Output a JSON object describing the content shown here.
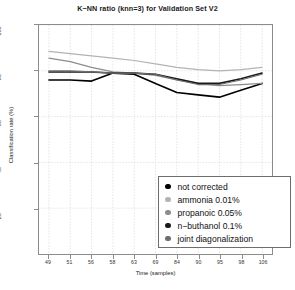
{
  "chart_data": {
    "type": "line",
    "title": "K−NN ratio (knn=3) for Validation Set V2",
    "xlabel": "Time (samples)",
    "ylabel": "Classification rate (%)",
    "xlim": [
      0,
      10
    ],
    "ylim": [
      0,
      100
    ],
    "grid": true,
    "legend_position": "bottom-right",
    "categories": [
      "49",
      "51",
      "56",
      "58",
      "63",
      "69",
      "84",
      "90",
      "95",
      "98",
      "106"
    ],
    "yticks": [
      "100",
      "80",
      "60",
      "40",
      "20"
    ],
    "ytick_values": [
      100,
      80,
      60,
      40,
      20
    ],
    "series": [
      {
        "name": "not corrected",
        "color": "#000000",
        "width": 1.6,
        "values": [
          76,
          76,
          75.5,
          79,
          78.5,
          74.5,
          70.5,
          69.5,
          68.5,
          71.5,
          74.5
        ]
      },
      {
        "name": "ammonia 0.01%",
        "color": "#b3b3b3",
        "width": 1.2,
        "values": [
          88.5,
          87.5,
          86.5,
          85.5,
          84.5,
          83,
          81.5,
          80.5,
          80,
          80.5,
          81.5
        ]
      },
      {
        "name": "propanoic 0.05%",
        "color": "#8c8c8c",
        "width": 1.2,
        "values": [
          85.5,
          84,
          81.5,
          79.5,
          79,
          78,
          76,
          74.5,
          73.5,
          74,
          74.5
        ]
      },
      {
        "name": "n−buthanol 0.1%",
        "color": "#1a1a1a",
        "width": 1.6,
        "values": [
          79.5,
          79.5,
          79.5,
          79,
          79,
          78.5,
          76.5,
          74.5,
          74.5,
          76.5,
          79
        ]
      },
      {
        "name": "joint diagonalization",
        "color": "#6e6e6e",
        "width": 1.2,
        "values": [
          80,
          80,
          79.5,
          79,
          79,
          78.5,
          76,
          74,
          74,
          76,
          78.5
        ]
      }
    ]
  },
  "legend": {
    "items": [
      {
        "label": "not corrected",
        "color": "#000000"
      },
      {
        "label": "ammonia 0.01%",
        "color": "#b3b3b3"
      },
      {
        "label": "propanoic 0.05%",
        "color": "#8c8c8c"
      },
      {
        "label": "n−buthanol 0.1%",
        "color": "#1a1a1a"
      },
      {
        "label": "joint diagonalization",
        "color": "#6e6e6e"
      }
    ]
  }
}
